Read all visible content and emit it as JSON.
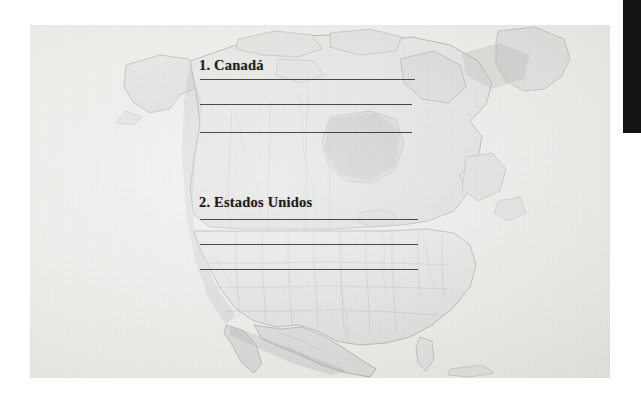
{
  "document": {
    "type": "worksheet-page",
    "language": "es",
    "page_background": "#e9e9e7",
    "ink_color": "#1d1d1b",
    "rule_color": "#3a3a38"
  },
  "map": {
    "name": "north-america-map",
    "description": "Mapa fisico-politico de America del Norte",
    "land_color": "#dedede",
    "water_color": "#eceae6",
    "highlight_color": "#c9c9c7",
    "border_color": "#9a9a96"
  },
  "exercises": [
    {
      "number": "1.",
      "label": "1. Canadá",
      "answer_lines": 3
    },
    {
      "number": "2.",
      "label": "2. Estados Unidos",
      "answer_lines": 3
    }
  ],
  "edge_bar": {
    "label": "scanner-edge-bar",
    "color": "#131314"
  }
}
